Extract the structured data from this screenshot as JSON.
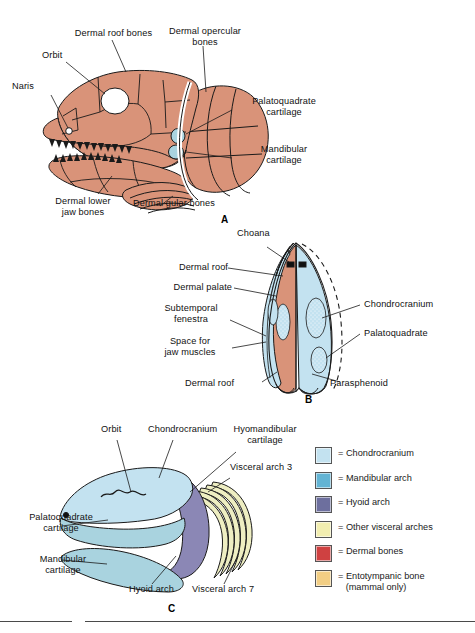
{
  "figure": {
    "title_absent": true,
    "panels": [
      {
        "id": "A",
        "id_label": "A",
        "caption_labels": [
          {
            "name": "dermal-roof-bones",
            "text": "Dermal roof bones"
          },
          {
            "name": "orbit",
            "text": "Orbit"
          },
          {
            "name": "naris",
            "text": "Naris"
          },
          {
            "name": "dermal-opercular-bones",
            "text": "Dermal opercular\nbones"
          },
          {
            "name": "palatoquadrate-cartilage",
            "text": "Palatoquadrate\ncartilage"
          },
          {
            "name": "mandibular-cartilage",
            "text": "Mandibular\ncartilage"
          },
          {
            "name": "dermal-lower-jaw-bones",
            "text": "Dermal lower\njaw bones"
          },
          {
            "name": "dermal-gular-bones",
            "text": "Dermal gular bones"
          }
        ]
      },
      {
        "id": "B",
        "id_label": "B",
        "caption_labels": [
          {
            "name": "choana",
            "text": "Choana"
          },
          {
            "name": "dermal-roof-upper",
            "text": "Dermal roof"
          },
          {
            "name": "dermal-palate",
            "text": "Dermal palate"
          },
          {
            "name": "subtemporal-fenestra",
            "text": "Subtemporal\nfenestra"
          },
          {
            "name": "space-for-jaw-muscles",
            "text": "Space for\njaw muscles"
          },
          {
            "name": "dermal-roof-lower",
            "text": "Dermal roof"
          },
          {
            "name": "chondrocranium",
            "text": "Chondrocranium"
          },
          {
            "name": "palatoquadrate",
            "text": "Palatoquadrate"
          },
          {
            "name": "parasphenoid",
            "text": "Parasphenoid"
          }
        ]
      },
      {
        "id": "C",
        "id_label": "C",
        "caption_labels": [
          {
            "name": "orbit",
            "text": "Orbit"
          },
          {
            "name": "chondrocranium",
            "text": "Chondrocranium"
          },
          {
            "name": "hyomandibular-cartilage",
            "text": "Hyomandibular\ncartilage"
          },
          {
            "name": "visceral-arch-3",
            "text": "Visceral arch 3"
          },
          {
            "name": "palatoquadrate-cartilage",
            "text": "Palatoquadrate\ncartilage"
          },
          {
            "name": "mandibular-cartilage",
            "text": "Mandibular\ncartilage"
          },
          {
            "name": "hyoid-arch",
            "text": "Hyoid arch"
          },
          {
            "name": "visceral-arch-7",
            "text": "Visceral arch 7"
          }
        ]
      }
    ]
  },
  "legend": {
    "items": [
      {
        "name": "chondrocranium",
        "label": "= Chondrocranium",
        "color": "#c3e2f0"
      },
      {
        "name": "mandibular-arch",
        "label": "= Mandibular arch",
        "color": "#63b4d4"
      },
      {
        "name": "hyoid-arch",
        "label": "= Hyoid arch",
        "color": "#6d6f9e"
      },
      {
        "name": "other-visceral-arches",
        "label": "= Other visceral arches",
        "color": "#f2eeb0"
      },
      {
        "name": "dermal-bones",
        "label": "= Dermal bones",
        "color": "#cf4141"
      },
      {
        "name": "entotympanic-bone",
        "label": "= Entotympanic bone\n   (mammal only)",
        "color": "#f2ce84"
      }
    ]
  },
  "colors": {
    "dermal_bone_fill": "#d99379",
    "chondrocranium_fill": "#c3e2f0",
    "mandibular_fill": "#a9d3df",
    "hyoid_fill": "#8b87b5",
    "visceral_fill": "#eeeec2",
    "outline": "#1a1a1a",
    "background": "#ffffff"
  }
}
